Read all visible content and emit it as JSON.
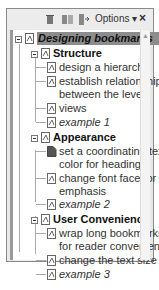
{
  "toolbar": {
    "icons": [
      "delete-bookmark-icon",
      "new-bookmark-icon",
      "expand-bookmark-icon"
    ],
    "options_label": "Options",
    "options_arrow": "▾",
    "close_label": "×"
  },
  "tree": {
    "root": {
      "label": "Designing bookmarks",
      "selected": true,
      "expanded": true
    },
    "groups": [
      {
        "label": "Structure",
        "expanded": true,
        "children": [
          {
            "lines": [
              "design a hierarchy"
            ]
          },
          {
            "lines": [
              "establish relationships",
              "between the levels"
            ]
          },
          {
            "lines": [
              "views"
            ]
          },
          {
            "lines": [
              "example 1"
            ],
            "italic": true
          }
        ]
      },
      {
        "label": "Appearance",
        "expanded": true,
        "children": [
          {
            "lines": [
              "set a coordinating text",
              "color for headings"
            ],
            "icon": "filled-bookmark"
          },
          {
            "lines": [
              "change font face for",
              "emphasis"
            ]
          },
          {
            "lines": [
              "example 2"
            ],
            "italic": true
          }
        ]
      },
      {
        "label": "User Convenience",
        "expanded": true,
        "children": [
          {
            "lines": [
              "wrap long bookmarks",
              "for reader convenience"
            ]
          },
          {
            "lines": [
              "change the text size"
            ]
          },
          {
            "lines": [
              "example 3"
            ],
            "italic": true
          }
        ]
      }
    ]
  },
  "scrollbar": {
    "up_arrow": "▲"
  }
}
